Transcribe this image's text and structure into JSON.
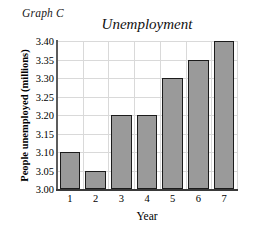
{
  "graph_label": "Graph C",
  "chart_data": {
    "type": "bar",
    "title": "Unemployment",
    "xlabel": "Year",
    "ylabel": "People unemployed (millions)",
    "categories": [
      "1",
      "2",
      "3",
      "4",
      "5",
      "6",
      "7"
    ],
    "values": [
      3.1,
      3.05,
      3.2,
      3.2,
      3.3,
      3.35,
      3.4
    ],
    "ylim": [
      3.0,
      3.4
    ],
    "ytick_step": 0.05,
    "ytick_labels": [
      "3.00",
      "3.05",
      "3.10",
      "3.15",
      "3.20",
      "3.25",
      "3.30",
      "3.35",
      "3.40"
    ],
    "grid": true,
    "legend": null,
    "bar_color": "#9a9a9a",
    "bar_edge_color": "#1c1c1c",
    "grid_color": "#d9d9d9",
    "background": "#ffffff"
  }
}
